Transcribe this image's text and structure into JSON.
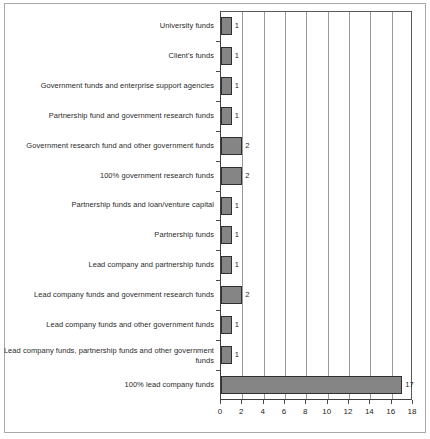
{
  "chart_data": {
    "type": "bar",
    "orientation": "horizontal",
    "title": "",
    "subtitle": "",
    "xlabel": "",
    "ylabel": "",
    "xlim": [
      0,
      18
    ],
    "xticks": [
      0,
      2,
      4,
      6,
      8,
      10,
      12,
      14,
      16,
      18
    ],
    "xtick_labels": [
      "0",
      "2",
      "4",
      "6",
      "8",
      "10",
      "12",
      "14",
      "16",
      "18"
    ],
    "grid": "vertical",
    "legend": "none",
    "bar_color": "#858585",
    "bar_edge_color": "#2f2f2f",
    "categories": [
      "University funds",
      "Client's funds",
      "Government funds and enterprise support agencies",
      "Partnership fund and government research funds",
      "Government research fund and other government funds",
      "100% government research funds",
      "Partnership funds and loan/venture capital",
      "Partnership funds",
      "Lead company and partnership funds",
      "Lead company funds and government research funds",
      "Lead company funds and other government funds",
      "Lead company funds, partnership funds and other government funds",
      "100% lead company funds"
    ],
    "values": [
      1,
      1,
      1,
      1,
      2,
      2,
      1,
      1,
      1,
      2,
      1,
      1,
      17
    ],
    "data_labels": [
      "1",
      "1",
      "1",
      "1",
      "2",
      "2",
      "1",
      "1",
      "1",
      "2",
      "1",
      "1",
      "17"
    ]
  }
}
